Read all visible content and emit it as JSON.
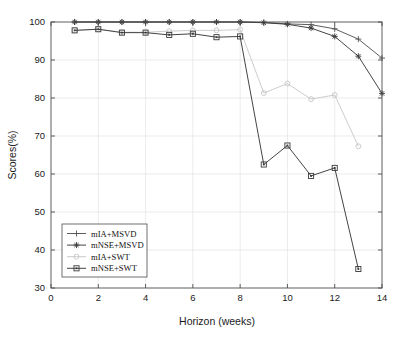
{
  "chart_data": {
    "type": "line",
    "title": "",
    "xlabel": "Horizon (weeks)",
    "ylabel": "Scores(%)",
    "xlim": [
      0,
      14
    ],
    "ylim": [
      30,
      100
    ],
    "xticks": [
      0,
      2,
      4,
      6,
      8,
      10,
      12,
      14
    ],
    "yticks": [
      30,
      40,
      50,
      60,
      70,
      80,
      90,
      100
    ],
    "xtick_labels": [
      "0",
      "2",
      "4",
      "6",
      "8",
      "10",
      "12",
      "14"
    ],
    "ytick_labels": [
      "30",
      "40",
      "50",
      "60",
      "70",
      "80",
      "90",
      "100"
    ],
    "grid": true,
    "legend_position": "lower-left",
    "x": [
      1,
      2,
      3,
      4,
      5,
      6,
      7,
      8,
      9,
      10,
      11,
      12,
      13,
      14
    ],
    "series": [
      {
        "name": "mIA+MSVD",
        "marker": "plus",
        "color": "#545454",
        "values": [
          100,
          100,
          100,
          100,
          100,
          100,
          100,
          100,
          99.9,
          99.5,
          99.3,
          98.2,
          95.5,
          90.5
        ]
      },
      {
        "name": "mNSE+MSVD",
        "marker": "asterisk",
        "color": "#3a3a3a",
        "values": [
          100,
          100,
          100,
          100,
          100,
          100,
          100,
          100,
          99.8,
          99.4,
          98.4,
          96.2,
          91.0,
          81.2
        ]
      },
      {
        "name": "mIA+SWT",
        "marker": "circle",
        "color": "#c6c6c6",
        "values": [
          97.8,
          98.1,
          97.3,
          97.3,
          97.6,
          97.8,
          97.8,
          98.0,
          81.3,
          83.8,
          79.7,
          80.8,
          67.3,
          null
        ]
      },
      {
        "name": "mNSE+SWT",
        "marker": "square",
        "color": "#3a3a3a",
        "values": [
          97.8,
          98.1,
          97.2,
          97.2,
          96.6,
          96.9,
          96.0,
          96.2,
          62.5,
          67.5,
          59.5,
          61.6,
          35.0,
          null
        ]
      }
    ]
  },
  "legend": {
    "entries": [
      {
        "label": "mIA+MSVD"
      },
      {
        "label": "mNSE+MSVD"
      },
      {
        "label": "mIA+SWT"
      },
      {
        "label": "mNSE+SWT"
      }
    ]
  }
}
